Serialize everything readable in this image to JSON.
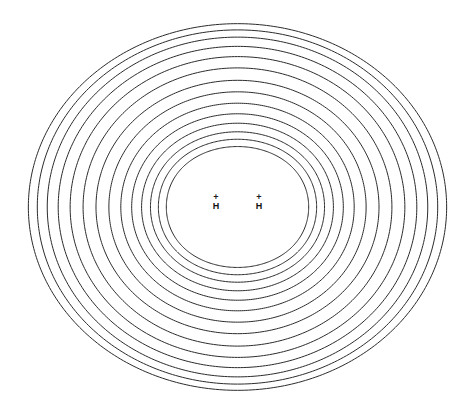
{
  "figure": {
    "title": "",
    "background_color": "#ffffff",
    "width": 468,
    "height": 418
  },
  "atoms": [
    {
      "symbol": "H",
      "charge": "+",
      "x": 216,
      "y": 206,
      "label_name": "atom-label-h-left"
    },
    {
      "symbol": "H",
      "charge": "+",
      "x": 259,
      "y": 206,
      "label_name": "atom-label-h-right"
    }
  ],
  "chart_data": {
    "type": "line",
    "title": "",
    "subtitle": "",
    "xlabel": "",
    "ylabel": "",
    "grid": false,
    "legend": null,
    "plot_kind": "contour",
    "contour_color": "#2b2b2b",
    "contour_line_width": 1,
    "contour_count": 14,
    "nuclei_positions": [
      [
        216,
        206
      ],
      [
        259,
        206
      ]
    ],
    "center": [
      237.5,
      207
    ],
    "annotations": [
      "+",
      "H",
      "+",
      "H"
    ],
    "contours": [
      {
        "index": 1,
        "rx": 70.0,
        "ry": 66.0,
        "waist": 0.72
      },
      {
        "index": 2,
        "rx": 78.0,
        "ry": 73.0,
        "waist": 0.76
      },
      {
        "index": 3,
        "rx": 86.0,
        "ry": 80.0,
        "waist": 0.8
      },
      {
        "index": 4,
        "rx": 95.0,
        "ry": 88.0,
        "waist": 0.84
      },
      {
        "index": 5,
        "rx": 105.0,
        "ry": 97.0,
        "waist": 0.87
      },
      {
        "index": 6,
        "rx": 116.0,
        "ry": 107.0,
        "waist": 0.9
      },
      {
        "index": 7,
        "rx": 128.0,
        "ry": 118.0,
        "waist": 0.92
      },
      {
        "index": 8,
        "rx": 141.0,
        "ry": 129.0,
        "waist": 0.94
      },
      {
        "index": 9,
        "rx": 154.0,
        "ry": 141.0,
        "waist": 0.955
      },
      {
        "index": 10,
        "rx": 167.0,
        "ry": 152.0,
        "waist": 0.965
      },
      {
        "index": 11,
        "rx": 179.0,
        "ry": 162.0,
        "waist": 0.972
      },
      {
        "index": 12,
        "rx": 190.0,
        "ry": 171.0,
        "waist": 0.978
      },
      {
        "index": 13,
        "rx": 200.0,
        "ry": 178.0,
        "waist": 0.983
      },
      {
        "index": 14,
        "rx": 209.0,
        "ry": 184.0,
        "waist": 0.988
      }
    ],
    "xlim": [
      24,
      447
    ],
    "ylim": [
      27,
      393
    ]
  }
}
